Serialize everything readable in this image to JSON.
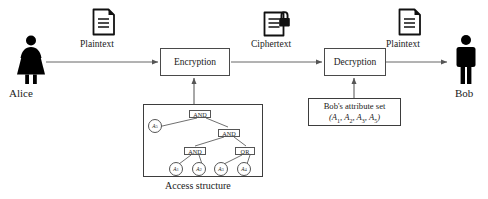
{
  "diagram": {
    "caption": "Access structure",
    "colors": {
      "stroke": "#3d3d3d",
      "box_stroke": "#4a4a4a",
      "arrow": "#555555",
      "figure": "#000000",
      "background": "#ffffff",
      "text": "#1a1a1a"
    }
  },
  "actors": {
    "sender": {
      "label": "Alice",
      "icon": "female-person-icon"
    },
    "receiver": {
      "label": "Bob",
      "icon": "male-person-icon"
    }
  },
  "flow_labels": [
    {
      "id": "plaintext-in",
      "label": "Plaintext",
      "icon": "document-icon"
    },
    {
      "id": "ciphertext",
      "label": "Ciphertext",
      "icon": "document-lock-icon"
    },
    {
      "id": "plaintext-out",
      "label": "Plaintext",
      "icon": "document-icon"
    }
  ],
  "processes": [
    {
      "id": "encryption",
      "label": "Encryption"
    },
    {
      "id": "decryption",
      "label": "Decryption"
    }
  ],
  "attribute_set": {
    "title": "Bob's attribute set",
    "values": [
      "A",
      "A",
      "A",
      "A"
    ],
    "subscripts": [
      "1",
      "2",
      "3",
      "5"
    ],
    "display": "(A1, A2, A3, A5)"
  },
  "access_structure": {
    "caption": "Access structure",
    "nodes": [
      {
        "id": "root",
        "type": "gate",
        "label": "AND"
      },
      {
        "id": "a5",
        "type": "leaf",
        "label": "A",
        "sub": "5"
      },
      {
        "id": "and-2",
        "type": "gate",
        "label": "AND"
      },
      {
        "id": "and-3",
        "type": "gate",
        "label": "AND"
      },
      {
        "id": "or-1",
        "type": "gate",
        "label": "OR"
      },
      {
        "id": "leaf-a1",
        "type": "leaf",
        "label": "A",
        "sub": "1"
      },
      {
        "id": "leaf-a2",
        "type": "leaf",
        "label": "A",
        "sub": "2"
      },
      {
        "id": "leaf-a3",
        "type": "leaf",
        "label": "A",
        "sub": "3"
      },
      {
        "id": "leaf-a4",
        "type": "leaf",
        "label": "A",
        "sub": "4"
      }
    ],
    "edges": [
      [
        "root",
        "a5"
      ],
      [
        "root",
        "and-2"
      ],
      [
        "and-2",
        "and-3"
      ],
      [
        "and-2",
        "or-1"
      ],
      [
        "and-3",
        "leaf-a1"
      ],
      [
        "and-3",
        "leaf-a2"
      ],
      [
        "or-1",
        "leaf-a3"
      ],
      [
        "or-1",
        "leaf-a4"
      ]
    ]
  }
}
